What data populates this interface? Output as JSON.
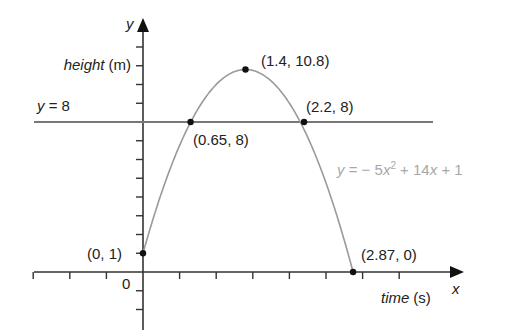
{
  "chart_data": {
    "type": "line",
    "title": "",
    "xlabel": "time (s)",
    "ylabel": "height (m)",
    "x_axis_letter": "x",
    "y_axis_letter": "y",
    "origin_label": "0",
    "xlim": [
      -3,
      3.5
    ],
    "ylim": [
      -3,
      12
    ],
    "x_tick_step": 0.5,
    "y_tick_step": 1,
    "grid": false,
    "series": [
      {
        "name": "y = −5x² + 14x + 1",
        "equation": {
          "a": -5,
          "b": 14,
          "c": 1
        },
        "domain": [
          0,
          2.87
        ],
        "color": "#9a9a9a"
      },
      {
        "name": "y = 8",
        "value": 8,
        "color": "#666666"
      }
    ],
    "points": [
      {
        "x": 0,
        "y": 1,
        "label": "(0, 1)"
      },
      {
        "x": 0.65,
        "y": 8,
        "label": "(0.65, 8)"
      },
      {
        "x": 1.4,
        "y": 10.8,
        "label": "(1.4, 10.8)"
      },
      {
        "x": 2.2,
        "y": 8,
        "label": "(2.2, 8)"
      },
      {
        "x": 2.87,
        "y": 0,
        "label": "(2.87, 0)"
      }
    ],
    "annotations": {
      "horizontal_line_label": "y = 8",
      "equation_label": "y = − 5x² + 14x + 1"
    }
  },
  "labels": {
    "height_prefix": "height",
    "height_unit": "(m)",
    "time_prefix": "time",
    "time_unit": "(s)",
    "y_letter": "y",
    "x_letter": "x",
    "origin": "0",
    "hline_y": "y",
    "hline_rest": " = 8",
    "eq_y": "y",
    "eq_mid1": " = − 5",
    "eq_x1": "x",
    "eq_sup": "2",
    "eq_mid2": " + 14",
    "eq_x2": "x",
    "eq_end": " + 1",
    "pt0": "(0, 1)",
    "pt1": "(0.65, 8)",
    "pt2": "(1.4, 10.8)",
    "pt3": "(2.2, 8)",
    "pt4": "(2.87, 0)"
  }
}
